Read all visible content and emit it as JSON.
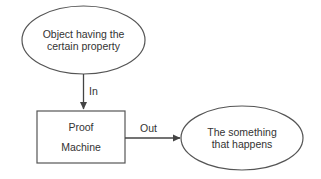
{
  "diagram": {
    "type": "flowchart",
    "nodes": {
      "input": {
        "shape": "ellipse",
        "line1": "Object having the",
        "line2": "certain property"
      },
      "machine": {
        "shape": "rectangle",
        "line1": "Proof",
        "line2": "Machine"
      },
      "output": {
        "shape": "ellipse",
        "line1": "The something",
        "line2": "that happens"
      }
    },
    "edges": {
      "in": {
        "from": "input",
        "to": "machine",
        "label": "In"
      },
      "out": {
        "from": "machine",
        "to": "output",
        "label": "Out"
      }
    },
    "colors": {
      "stroke": "#555555",
      "text": "#333333",
      "background": "#ffffff"
    }
  }
}
